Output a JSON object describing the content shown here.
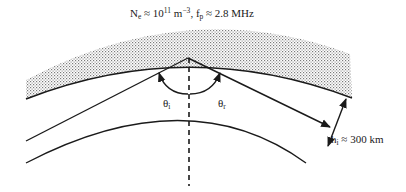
{
  "figure": {
    "title_parts": {
      "ne_symbol": "N",
      "ne_sub": "e",
      "ne_value": " ≈ 10",
      "ne_exp": "11",
      "ne_unit": " m",
      "ne_unit_exp": "−3",
      "sep": ", ",
      "fp_symbol": "f",
      "fp_sub": "p",
      "fp_value": " ≈ 2.8 MHz"
    },
    "angle_incident": {
      "symbol": "θ",
      "sub": "i"
    },
    "angle_reflected": {
      "symbol": "θ",
      "sub": "r"
    },
    "height": {
      "symbol": "h",
      "sub": "i",
      "value": " ≈ 300 km"
    }
  },
  "style": {
    "line_color": "#1a1a1a",
    "hatch_color": "#8a8a8a"
  }
}
